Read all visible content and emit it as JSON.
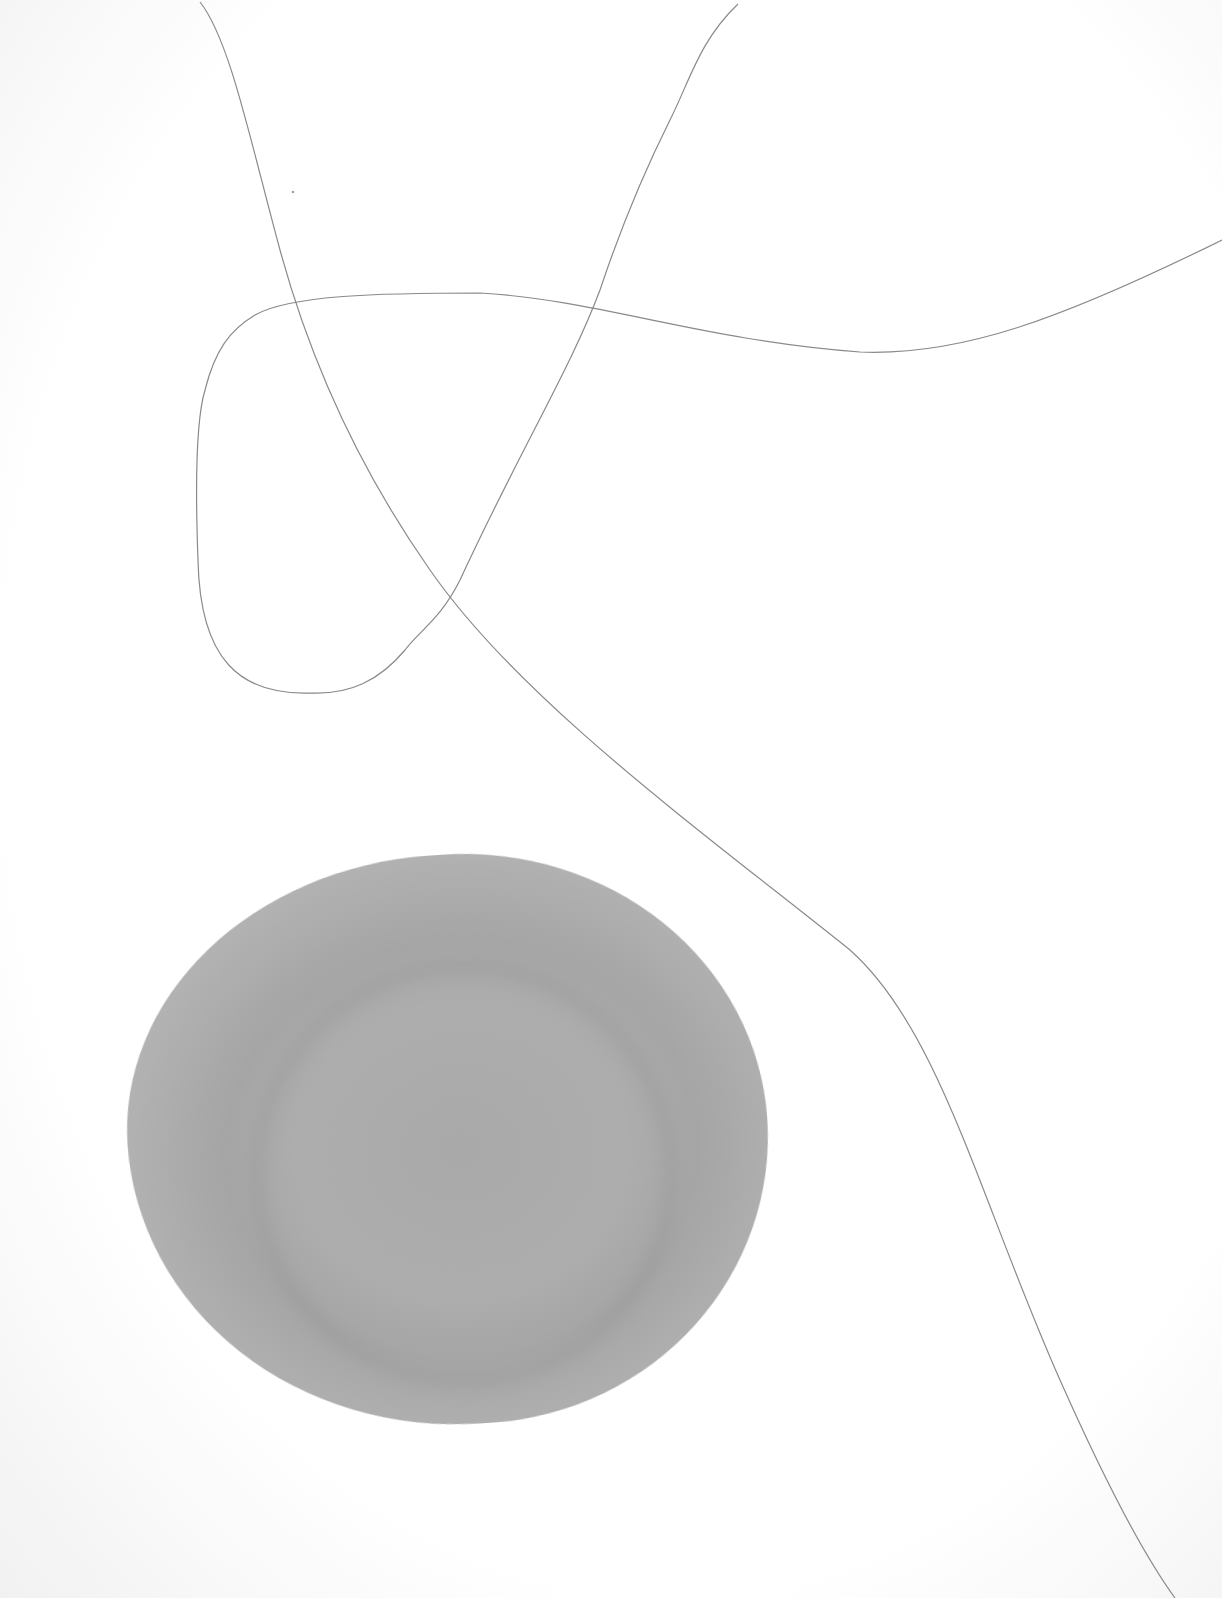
{
  "artwork": {
    "description": "Abstract minimalist composition: thin wandering pencil lines and a grey watercolor circle on white paper",
    "colors": {
      "paper": "#ffffff",
      "line": "#8a8a8a",
      "blot": "#adadad"
    },
    "elements": [
      "line-1",
      "line-2",
      "loop-line",
      "watercolor-circle"
    ]
  }
}
